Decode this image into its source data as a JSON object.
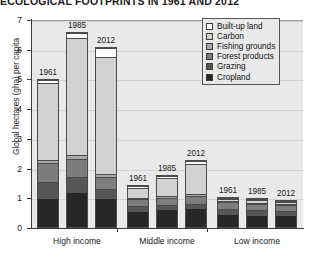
{
  "chart": {
    "title": "ECOLOGICAL FOOTPRINTS IN 1961 AND 2012",
    "ylabel": "Global hectares (gha) per capita"
  },
  "axis": {
    "yticks": [
      "0",
      "1",
      "2",
      "3",
      "4",
      "5",
      "6",
      "7"
    ],
    "groups": [
      "High income",
      "Middle income",
      "Low income"
    ]
  },
  "legend": {
    "items": [
      {
        "label": "Built-up land",
        "color": "#ffffff"
      },
      {
        "label": "Carbon",
        "color": "#d2d2d2"
      },
      {
        "label": "Fishing grounds",
        "color": "#a8a8a8"
      },
      {
        "label": "Forest products",
        "color": "#7d7d7d"
      },
      {
        "label": "Grazing",
        "color": "#565656"
      },
      {
        "label": "Cropland",
        "color": "#272727"
      }
    ]
  },
  "chart_data": {
    "type": "bar",
    "subtype": "stacked-bar",
    "title": "ECOLOGICAL FOOTPRINTS IN 1961 AND 2012",
    "xlabel": "",
    "ylabel": "Global hectares (gha) per capita",
    "ylim": [
      0,
      7
    ],
    "yticks": [
      0,
      1,
      2,
      3,
      4,
      5,
      6,
      7
    ],
    "grid": true,
    "legend_position": "top-right",
    "categories": [
      "High income",
      "Middle income",
      "Low income"
    ],
    "years": [
      "1961",
      "1985",
      "2012"
    ],
    "series": [
      {
        "name": "Cropland",
        "color": "#272727",
        "values": {
          "High income": [
            0.95,
            1.15,
            0.95
          ],
          "Middle income": [
            0.52,
            0.58,
            0.62
          ],
          "Low income": [
            0.45,
            0.42,
            0.4
          ]
        }
      },
      {
        "name": "Grazing",
        "color": "#565656",
        "values": {
          "High income": [
            0.6,
            0.55,
            0.35
          ],
          "Middle income": [
            0.22,
            0.2,
            0.18
          ],
          "Low income": [
            0.22,
            0.2,
            0.18
          ]
        }
      },
      {
        "name": "Forest products",
        "color": "#7d7d7d",
        "values": {
          "High income": [
            0.62,
            0.62,
            0.4
          ],
          "Middle income": [
            0.25,
            0.24,
            0.26
          ],
          "Low income": [
            0.25,
            0.24,
            0.24
          ]
        }
      },
      {
        "name": "Fishing grounds",
        "color": "#a8a8a8",
        "values": {
          "High income": [
            0.1,
            0.12,
            0.12
          ],
          "Middle income": [
            0.05,
            0.06,
            0.08
          ],
          "Low income": [
            0.04,
            0.04,
            0.04
          ]
        }
      },
      {
        "name": "Carbon",
        "color": "#d2d2d2",
        "values": {
          "High income": [
            2.65,
            4.0,
            3.95
          ],
          "Middle income": [
            0.35,
            0.64,
            1.04
          ],
          "Low income": [
            0.06,
            0.08,
            0.07
          ]
        }
      },
      {
        "name": "Built-up land",
        "color": "#ffffff",
        "values": {
          "High income": [
            0.08,
            0.16,
            0.33
          ],
          "Middle income": [
            0.06,
            0.08,
            0.12
          ],
          "Low income": [
            0.03,
            0.02,
            0.02
          ]
        }
      }
    ],
    "totals": {
      "High income": [
        5.0,
        6.6,
        6.1
      ],
      "Middle income": [
        1.45,
        1.8,
        2.3
      ],
      "Low income": [
        1.05,
        1.0,
        0.95
      ]
    }
  }
}
